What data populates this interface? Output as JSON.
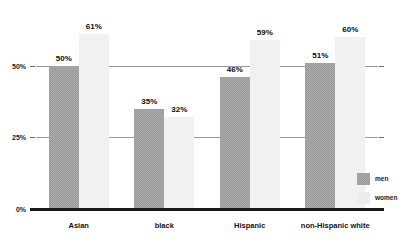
{
  "chart_data": {
    "type": "bar",
    "title": "",
    "xlabel": "",
    "ylabel": "",
    "ylim": [
      0,
      68
    ],
    "grid": true,
    "legend_position": "right",
    "categories": [
      "Asian",
      "black",
      "Hispanic",
      "non-Hispanic white"
    ],
    "ytick_labels": [
      "0%",
      "25%",
      "50%"
    ],
    "ytick_values": [
      0,
      25,
      50
    ],
    "series": [
      {
        "name": "men",
        "color": "#9a9a9a",
        "values": [
          50,
          35,
          46,
          51
        ],
        "data_labels": [
          "50%",
          "35%",
          "46%",
          "51%"
        ]
      },
      {
        "name": "women",
        "color": "#ececec",
        "values": [
          61,
          32,
          59,
          60
        ],
        "data_labels": [
          "61%",
          "32%",
          "59%",
          "60%"
        ]
      }
    ]
  },
  "legend": {
    "items": [
      {
        "label": "men"
      },
      {
        "label": "women"
      }
    ]
  }
}
